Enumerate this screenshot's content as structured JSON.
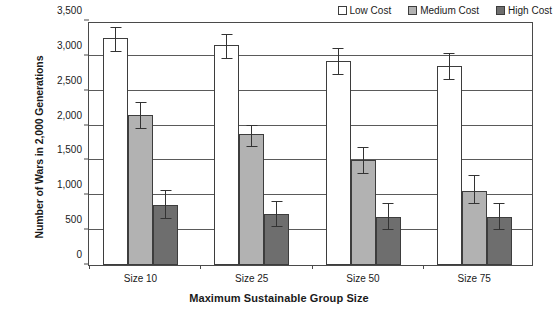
{
  "chart_data": {
    "type": "bar",
    "title": "",
    "xlabel": "Maximum Sustainable Group Size",
    "ylabel": "Number of Wars in 2,000 Generations",
    "categories": [
      "Size 10",
      "Size 25",
      "Size 50",
      "Size 75"
    ],
    "ylim": [
      0,
      3500
    ],
    "yticks": [
      0,
      500,
      1000,
      1500,
      2000,
      2500,
      3000,
      3500
    ],
    "ytick_labels": [
      "0",
      "500",
      "1,000",
      "1,500",
      "2,000",
      "2,500",
      "3,000",
      "3,500"
    ],
    "grid": true,
    "legend_position": "top-right",
    "error_bars": true,
    "series": [
      {
        "name": "Low Cost",
        "color": "#ffffff",
        "values": [
          3250,
          3150,
          2930,
          2850
        ],
        "err_low": [
          3050,
          2950,
          2730,
          2650
        ],
        "err_high": [
          3420,
          3320,
          3120,
          3040
        ]
      },
      {
        "name": "Medium Cost",
        "color": "#b2b2b2",
        "values": [
          2150,
          1880,
          1505,
          1060
        ],
        "err_low": [
          1955,
          1690,
          1310,
          875
        ],
        "err_high": [
          2340,
          2010,
          1700,
          1290
        ]
      },
      {
        "name": "High Cost",
        "color": "#6e6e6e",
        "values": [
          865,
          730,
          695,
          695
        ],
        "err_low": [
          655,
          545,
          500,
          505
        ],
        "err_high": [
          1075,
          925,
          895,
          895
        ]
      }
    ]
  },
  "legend": {
    "items": [
      {
        "label": "Low Cost",
        "swatch": "low"
      },
      {
        "label": "Medium Cost",
        "swatch": "medium"
      },
      {
        "label": "High Cost",
        "swatch": "high"
      }
    ]
  }
}
